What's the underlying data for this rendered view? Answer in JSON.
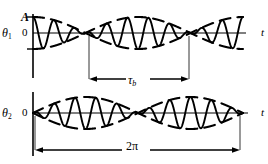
{
  "figure": {
    "background": "#ffffff",
    "ink_color": "#000000"
  },
  "labels": {
    "amplitude": "A",
    "zero_top": "0",
    "zero_bottom": "0",
    "theta1_symbol": "θ",
    "theta1_subscript": "1",
    "theta2_symbol": "θ",
    "theta2_subscript": "2",
    "time_axis_top": "t",
    "time_axis_bottom": "t",
    "beat_period": "τ",
    "beat_period_subscript": "b",
    "total_span": "2π"
  },
  "chart_data": {
    "type": "line",
    "xlabel": "t",
    "ylabel": "",
    "xlim": [
      0,
      6.283185307179586
    ],
    "ylim": [
      -1,
      1
    ],
    "grid": false,
    "legend": null,
    "annotations": [
      {
        "text": "A",
        "kind": "axis-tick",
        "panel": "top",
        "value": 1.0
      },
      {
        "text": "0",
        "kind": "axis-tick",
        "panel": "top",
        "value": 0.0
      },
      {
        "text": "0",
        "kind": "axis-tick",
        "panel": "bottom",
        "value": 0.0
      },
      {
        "text": "τ_b",
        "kind": "span-arrow",
        "panel": "top",
        "from_x": 1.5707963,
        "to_x": 4.712389,
        "note": "beat period between adjacent envelope nodes of theta1"
      },
      {
        "text": "2π",
        "kind": "span-arrow",
        "panel": "bottom",
        "from_x": 0.0,
        "to_x": 6.2831853,
        "note": "full horizontal span of the plotted interval"
      }
    ],
    "series": [
      {
        "name": "theta1",
        "panel": "top",
        "style": "solid-carrier",
        "description": "carrier cos(n t) modulated by cosine envelope, maximum at t=0",
        "amplitude": 1.0,
        "envelope": {
          "form": "cos",
          "expression": "A*cos(t)",
          "phase": 0.0,
          "nodes_x": [
            1.5707963,
            4.712389
          ],
          "antinodes_x": [
            0.0,
            3.1415927,
            6.2831853
          ]
        },
        "carrier": {
          "form": "cos",
          "cycles_over_span": 10,
          "expression": "cos(10 t)"
        }
      },
      {
        "name": "theta1_envelope_upper",
        "panel": "top",
        "style": "dashed",
        "description": "upper dashed envelope of theta1",
        "expression": "+|A*cos(t)|_signed = A*cos(t)"
      },
      {
        "name": "theta1_envelope_lower",
        "panel": "top",
        "style": "dashed",
        "description": "lower dashed envelope of theta1",
        "expression": "-A*cos(t)"
      },
      {
        "name": "theta2",
        "panel": "bottom",
        "style": "solid-carrier",
        "description": "carrier cos(n t) modulated by sine envelope, zero at t=0",
        "amplitude": 1.0,
        "envelope": {
          "form": "sin",
          "expression": "A*sin(t)",
          "phase": 0.0,
          "nodes_x": [
            0.0,
            3.1415927,
            6.2831853
          ],
          "antinodes_x": [
            1.5707963,
            4.712389
          ]
        },
        "carrier": {
          "form": "cos",
          "cycles_over_span": 10,
          "expression": "cos(10 t)"
        }
      },
      {
        "name": "theta2_envelope_upper",
        "panel": "bottom",
        "style": "dashed",
        "description": "upper dashed envelope of theta2",
        "expression": "A*sin(t)"
      },
      {
        "name": "theta2_envelope_lower",
        "panel": "bottom",
        "style": "dashed",
        "description": "lower dashed envelope of theta2",
        "expression": "-A*sin(t)"
      }
    ]
  }
}
